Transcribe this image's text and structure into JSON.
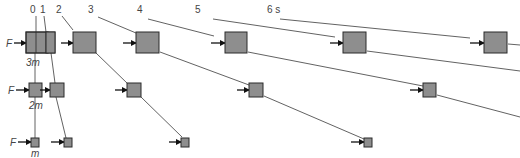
{
  "diagram": {
    "type": "motion-snapshot-sequence",
    "time_labels": [
      "0",
      "1",
      "2",
      "3",
      "4",
      "5",
      "6 s"
    ],
    "force_label": "F",
    "rows": [
      {
        "mass_label": "3m",
        "description": "largest block, slowest acceleration"
      },
      {
        "mass_label": "2m",
        "description": "medium block, intermediate acceleration"
      },
      {
        "mass_label": "m",
        "description": "smallest block, fastest acceleration"
      }
    ],
    "colors": {
      "block_fill": "#8e8e8e",
      "block_stroke": "#2a2a2a",
      "line": "#3a3a3a",
      "text": "#444444"
    }
  }
}
